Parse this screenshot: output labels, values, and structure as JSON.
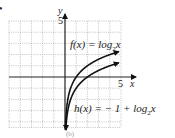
{
  "chart_data": {
    "type": "line",
    "title": "",
    "xlabel": "x",
    "ylabel": "y",
    "xlim": [
      -5,
      5
    ],
    "ylim": [
      -4.5,
      5
    ],
    "grid": true,
    "tick_labels": {
      "x": [
        "5"
      ],
      "y": [
        "5"
      ]
    },
    "series": [
      {
        "name": "f(x) = log2x",
        "label_text": "f(x) = log₂x",
        "x": [
          0.0625,
          0.125,
          0.25,
          0.5,
          1,
          2,
          4,
          4.8
        ],
        "y": [
          -4,
          -3,
          -2,
          -1,
          0,
          1,
          2,
          2.26
        ]
      },
      {
        "name": "h(x) = -1 + log2x",
        "label_text": "h(x) =  − 1 + log₂x",
        "x": [
          0.125,
          0.25,
          0.5,
          1,
          2,
          4,
          4.8
        ],
        "y": [
          -4,
          -3,
          -2,
          -1,
          0,
          1,
          1.26
        ]
      }
    ],
    "colors": {
      "curve": "#111111",
      "axis": "#222222",
      "grid": "#9a9a9a"
    }
  },
  "labels": {
    "y_axis": "y",
    "x_axis": "x",
    "y_tick_5": "5",
    "x_tick_5": "5",
    "f_name": "f(x) = log",
    "f_sub": "2",
    "f_var": "x",
    "h_name": "h(x) =  − 1 + log",
    "h_sub": "2",
    "h_var": "x",
    "caption": "(b)",
    "bullet": "•"
  }
}
